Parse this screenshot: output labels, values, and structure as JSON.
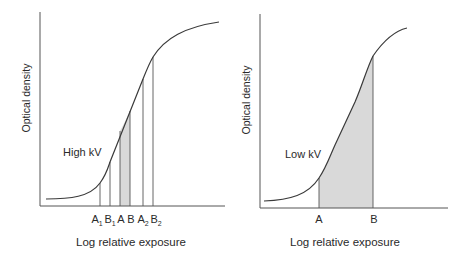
{
  "colors": {
    "axis": "#555555",
    "curve": "#3a3a3a",
    "shade": "#d9d9d9",
    "text": "#2a2a2a"
  },
  "panels": [
    {
      "id": "high-kv",
      "curve_label": "High kV",
      "y_axis_label": "Optical density",
      "x_axis_label": "Log relative exposure",
      "tick_labels": [
        {
          "main": "A",
          "sub": "1"
        },
        {
          "main": "B",
          "sub": "1"
        },
        {
          "main": "A",
          "sub": ""
        },
        {
          "main": "B",
          "sub": ""
        },
        {
          "main": "A",
          "sub": "2"
        },
        {
          "main": "B",
          "sub": "2"
        }
      ],
      "shaded_between": [
        "A",
        "B"
      ]
    },
    {
      "id": "low-kv",
      "curve_label": "Low kV",
      "y_axis_label": "Optical density",
      "x_axis_label": "Log relative exposure",
      "tick_labels": [
        {
          "main": "A",
          "sub": ""
        },
        {
          "main": "B",
          "sub": ""
        }
      ],
      "shaded_between": [
        "A",
        "B"
      ]
    }
  ]
}
